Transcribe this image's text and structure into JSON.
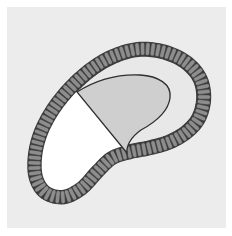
{
  "figure": {
    "type": "biological cross-section diagram",
    "labels": []
  },
  "colors": {
    "page_background": "#ffffff",
    "panel_background": "#ececec",
    "cell_fill": "#8d8d8d",
    "cell_outline": "#3a3a3a",
    "lumen_left": "#ffffff",
    "lumen_right": "#e8e8e8",
    "mass_fill": "#cfcfcf",
    "mass_outline": "#2e2e2e"
  },
  "parts": {
    "cell_layer": {
      "name": "epithelial cell layer",
      "segment_count": 96
    },
    "lumen": {
      "name": "lumen"
    },
    "mass": {
      "name": "shaded inner mass"
    }
  }
}
